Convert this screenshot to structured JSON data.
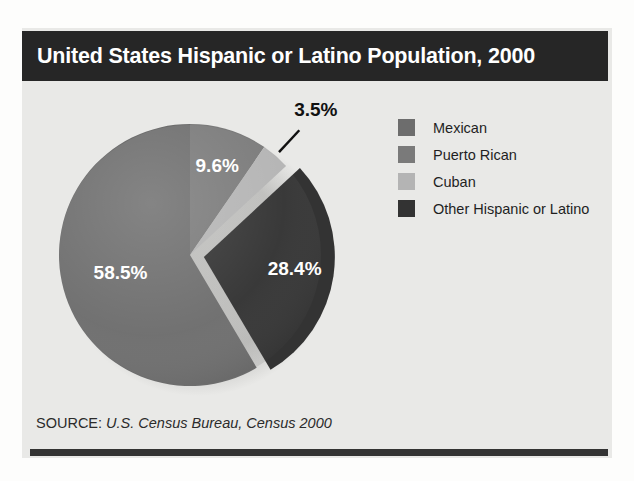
{
  "title": "United States Hispanic or Latino Population, 2000",
  "source": {
    "label": "SOURCE:",
    "value": "U.S. Census Bureau, Census 2000"
  },
  "legend": {
    "items": [
      {
        "label": "Mexican",
        "color": "#6d6d6d"
      },
      {
        "label": "Puerto Rican",
        "color": "#7a7a7a"
      },
      {
        "label": "Cuban",
        "color": "#b4b4b4"
      },
      {
        "label": "Other Hispanic or Latino",
        "color": "#333333"
      }
    ]
  },
  "chart_data": {
    "type": "pie",
    "title": "United States Hispanic or Latino Population, 2000",
    "categories": [
      "Mexican",
      "Puerto Rican",
      "Cuban",
      "Other Hispanic or Latino"
    ],
    "values": [
      58.5,
      9.6,
      3.5,
      28.4
    ],
    "value_labels": [
      "58.5%",
      "9.6%",
      "3.5%",
      "28.4%"
    ],
    "unit": "percent",
    "total": 100.0,
    "colors": [
      "#6d6d6d",
      "#7a7a7a",
      "#b4b4b4",
      "#333333"
    ],
    "label_positions": [
      "inside",
      "inside",
      "outside",
      "inside"
    ],
    "exploded": [
      "Other Hispanic or Latino"
    ],
    "start_angle_deg": 0,
    "direction": "clockwise",
    "draw_order": [
      "Puerto Rican",
      "Cuban",
      "Other Hispanic or Latino",
      "Mexican"
    ],
    "legend_position": "right",
    "grid": false,
    "xlabel": "",
    "ylabel": ""
  }
}
